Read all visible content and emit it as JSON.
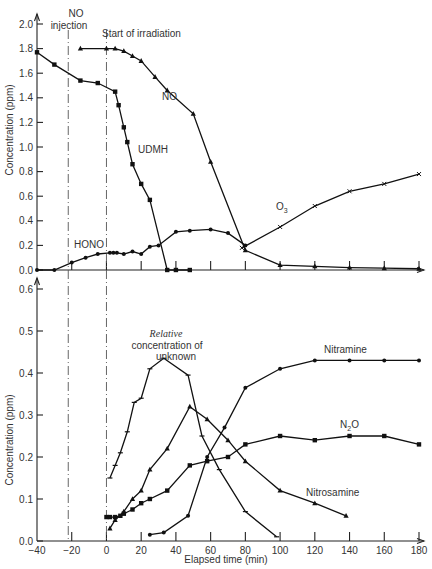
{
  "chart_data": [
    {
      "type": "line",
      "panel": "top",
      "title": "",
      "xlabel": "",
      "ylabel": "Concentration (ppm)",
      "xlim": [
        -40,
        180
      ],
      "ylim": [
        0.0,
        2.0
      ],
      "yticks": [
        "0.0",
        "0.2",
        "0.4",
        "0.6",
        "0.8",
        "1.0",
        "1.2",
        "1.4",
        "1.6",
        "1.8",
        "2.0"
      ],
      "xticks_minor": [
        -40,
        -20,
        0,
        20,
        40,
        60,
        80,
        100,
        120,
        140,
        160,
        180
      ],
      "annotations": [
        {
          "text": "NO",
          "x": -20,
          "y": 1.97
        },
        {
          "text": "injection",
          "x": -20,
          "y": 1.91
        },
        {
          "text": "Start of irradiation",
          "x": 16,
          "y": 1.9
        }
      ],
      "vlines": [
        {
          "x": -22,
          "label": "NO injection"
        },
        {
          "x": 0,
          "label": "Start of irradiation"
        }
      ],
      "series": [
        {
          "name": "NO",
          "marker": "triangle",
          "label_pos": [
            44,
            1.4
          ],
          "x": [
            -15,
            0,
            5,
            10,
            15,
            20,
            28,
            35,
            50,
            60,
            80,
            100,
            120,
            140,
            160,
            180
          ],
          "y": [
            1.8,
            1.8,
            1.8,
            1.78,
            1.74,
            1.7,
            1.57,
            1.46,
            1.27,
            0.88,
            0.16,
            0.04,
            0.03,
            0.02,
            0.015,
            0.01
          ]
        },
        {
          "name": "UDMH",
          "marker": "square",
          "label_pos": [
            32,
            1.06
          ],
          "x": [
            -40,
            -30,
            -15,
            -5,
            5,
            7,
            10,
            12,
            15,
            20,
            25,
            35,
            40,
            48
          ],
          "y": [
            1.77,
            1.67,
            1.54,
            1.52,
            1.45,
            1.34,
            1.16,
            1.04,
            0.86,
            0.7,
            0.57,
            0.0,
            0.0,
            0.0
          ]
        },
        {
          "name": "HONO",
          "marker": "dot",
          "label_pos": [
            -12,
            0.2
          ],
          "x": [
            -40,
            -30,
            -20,
            -12,
            -5,
            2,
            4,
            6,
            10,
            15,
            20,
            25,
            30,
            40,
            48,
            60,
            70,
            80
          ],
          "y": [
            0.0,
            0.0,
            0.06,
            0.1,
            0.13,
            0.14,
            0.14,
            0.14,
            0.13,
            0.15,
            0.13,
            0.19,
            0.2,
            0.31,
            0.32,
            0.33,
            0.3,
            0.2
          ]
        },
        {
          "name": "O3",
          "marker": "x",
          "label_pos": [
            86,
            0.48
          ],
          "x": [
            78,
            100,
            120,
            140,
            160,
            180
          ],
          "y": [
            0.18,
            0.35,
            0.52,
            0.64,
            0.7,
            0.78
          ]
        }
      ]
    },
    {
      "type": "line",
      "panel": "bottom",
      "title": "",
      "xlabel": "Elapsed time (min)",
      "ylabel": "Concentration (ppm)",
      "xlim": [
        -40,
        180
      ],
      "ylim": [
        0.0,
        0.6
      ],
      "xticks": [
        "-40",
        "-20",
        "0",
        "20",
        "40",
        "60",
        "80",
        "100",
        "120",
        "140",
        "160",
        "180"
      ],
      "yticks": [
        "0.0",
        "0.1",
        "0.2",
        "0.3",
        "0.4",
        "0.5",
        "0.6"
      ],
      "annotations": [
        {
          "text": "Relative",
          "x": 33,
          "y": 0.49,
          "style": "italic-serif"
        },
        {
          "text": "concentration of",
          "x": 33,
          "y": 0.47
        },
        {
          "text": "unknown",
          "x": 33,
          "y": 0.45
        }
      ],
      "series": [
        {
          "name": "Relative concentration of unknown",
          "marker": "tick",
          "x": [
            2,
            5,
            8,
            12,
            16,
            20,
            25,
            33,
            47,
            55,
            65,
            80,
            98
          ],
          "y": [
            0.15,
            0.18,
            0.21,
            0.26,
            0.33,
            0.34,
            0.41,
            0.435,
            0.395,
            0.25,
            0.17,
            0.07,
            0.01
          ]
        },
        {
          "name": "Nitramine",
          "marker": "dot",
          "label_pos": [
            127,
            0.445
          ],
          "x": [
            25,
            33,
            47,
            58,
            68,
            80,
            100,
            120,
            140,
            160,
            180
          ],
          "y": [
            0.015,
            0.02,
            0.06,
            0.2,
            0.27,
            0.365,
            0.41,
            0.43,
            0.43,
            0.43,
            0.43
          ]
        },
        {
          "name": "N2O",
          "marker": "square",
          "label_pos": [
            147,
            0.28
          ],
          "x": [
            0,
            2,
            5,
            8,
            10,
            15,
            20,
            25,
            35,
            48,
            58,
            70,
            80,
            100,
            120,
            140,
            160,
            180
          ],
          "y": [
            0.057,
            0.057,
            0.057,
            0.06,
            0.065,
            0.075,
            0.09,
            0.1,
            0.12,
            0.18,
            0.19,
            0.2,
            0.23,
            0.25,
            0.24,
            0.25,
            0.25,
            0.23
          ]
        },
        {
          "name": "Nitrosamine",
          "marker": "triangle",
          "label_pos": [
            128,
            0.115
          ],
          "x": [
            2,
            5,
            10,
            15,
            20,
            25,
            35,
            48,
            58,
            70,
            80,
            100,
            120,
            138
          ],
          "y": [
            0.03,
            0.05,
            0.07,
            0.1,
            0.12,
            0.17,
            0.22,
            0.32,
            0.29,
            0.24,
            0.19,
            0.12,
            0.09,
            0.06
          ]
        }
      ]
    }
  ],
  "labels": {
    "no_injection_line1": "NO",
    "no_injection_line2": "injection",
    "start_irradiation": "Start of irradiation",
    "no": "NO",
    "udmh": "UDMH",
    "hono": "HONO",
    "o3": "O",
    "o3_sub": "3",
    "relative": "Relative",
    "conc_of": "concentration of",
    "unknown": "unknown",
    "nitramine": "Nitramine",
    "n2o_n": "N",
    "n2o_sub": "2",
    "n2o_o": "O",
    "nitrosamine": "Nitrosamine",
    "ylabel": "Concentration (ppm)",
    "xlabel": "Elapsed time (min)"
  }
}
